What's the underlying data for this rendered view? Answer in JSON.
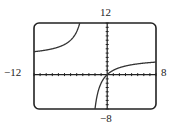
{
  "chart_data": {
    "type": "line",
    "title": "",
    "xlabel": "",
    "ylabel": "",
    "xlim": [
      -12,
      8
    ],
    "ylim": [
      -8,
      12
    ],
    "tick_labels": {
      "x_min": "−12",
      "x_max": "8",
      "y_min": "−8",
      "y_max": "12"
    },
    "xscale_tick": 1,
    "yscale_tick": 1,
    "grid": false,
    "function_estimate": "y = 4x/(x+3)",
    "vertical_asymptote": -3,
    "horizontal_asymptote": 4,
    "series": [
      {
        "name": "left branch",
        "x": [
          -12,
          -10,
          -8,
          -6,
          -5,
          -4,
          -3.6,
          -3.4
        ],
        "y": [
          5.33,
          5.71,
          6.4,
          8,
          10,
          16,
          24,
          34
        ]
      },
      {
        "name": "right branch",
        "x": [
          -2.4,
          -2,
          -1.5,
          -1,
          0,
          1,
          2,
          4,
          6,
          8
        ],
        "y": [
          -16,
          -8,
          -4,
          -2,
          0,
          1,
          1.6,
          2.29,
          2.67,
          2.91
        ]
      }
    ],
    "colors": {
      "curve": "#333333",
      "axes": "#222222",
      "frame": "#222222"
    }
  }
}
